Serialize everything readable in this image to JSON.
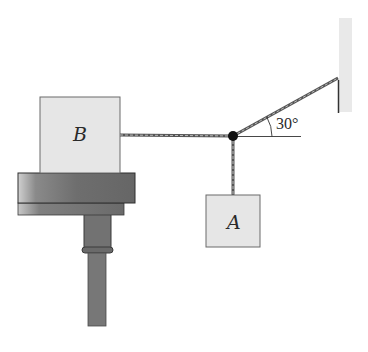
{
  "diagram": {
    "type": "statics-rope-system",
    "colors": {
      "block_fill": "#e6e6e6",
      "block_stroke": "#6a6a6a",
      "table_dark": "#6b6b6b",
      "table_mid": "#7c7c7c",
      "wall_fill": "#e8e8e8",
      "rope": "#555555",
      "knot": "#111111",
      "background": "#ffffff"
    },
    "block_b": {
      "label": "B"
    },
    "block_a": {
      "label": "A"
    },
    "angle": {
      "label": "30°",
      "value_deg": 30
    },
    "components": [
      "block B resting on table",
      "table on pedestal",
      "horizontal rope from B to knot",
      "rope from knot to wall at 30° above horizontal",
      "vertical rope from knot to hanging block A",
      "fixed wall support"
    ]
  }
}
